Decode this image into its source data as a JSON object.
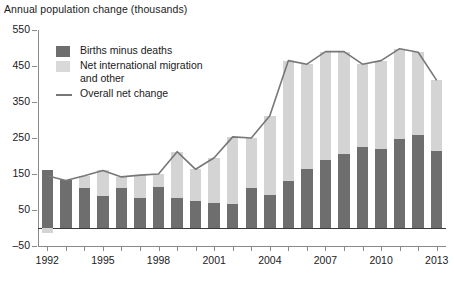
{
  "chart_data": {
    "type": "bar",
    "title": "Annual population change (thousands)",
    "xlabel": "",
    "ylabel": "",
    "ylim": [
      -50,
      550
    ],
    "yticks": [
      -50,
      50,
      150,
      250,
      350,
      450,
      550
    ],
    "ytick_labels": [
      "-50",
      "50",
      "150",
      "250",
      "350",
      "450",
      "550"
    ],
    "grid": false,
    "legend_position": "upper-left",
    "stacked": true,
    "categories": [
      1992,
      1993,
      1994,
      1995,
      1996,
      1997,
      1998,
      1999,
      2000,
      2001,
      2002,
      2003,
      2004,
      2005,
      2006,
      2007,
      2008,
      2009,
      2010,
      2011,
      2012,
      2013
    ],
    "xtick_labels": [
      "1992",
      "1995",
      "1998",
      "2001",
      "2004",
      "2007",
      "2010",
      "2013"
    ],
    "xtick_label_years": [
      1992,
      1995,
      1998,
      2001,
      2004,
      2007,
      2010,
      2013
    ],
    "series": [
      {
        "name": "Births minus deaths",
        "color": "#6e6e6e",
        "values": [
          160,
          132,
          110,
          88,
          112,
          82,
          115,
          82,
          75,
          70,
          68,
          110,
          92,
          130,
          165,
          190,
          205,
          225,
          220,
          248,
          258,
          215
        ]
      },
      {
        "name": "Net international migration and other",
        "color": "#d4d4d4",
        "values": [
          -15,
          0,
          35,
          72,
          30,
          65,
          35,
          130,
          88,
          125,
          185,
          140,
          220,
          335,
          290,
          300,
          285,
          230,
          245,
          250,
          230,
          195
        ]
      }
    ],
    "line_series": {
      "name": "Overall net change",
      "color": "#777777",
      "values": [
        145,
        132,
        145,
        160,
        142,
        147,
        150,
        212,
        163,
        195,
        253,
        250,
        312,
        465,
        455,
        490,
        490,
        455,
        465,
        498,
        488,
        410
      ]
    }
  },
  "legend": {
    "items": [
      {
        "label": "Births minus deaths",
        "marker": "swatch-dark"
      },
      {
        "label": "Net international migration\nand other",
        "marker": "swatch-light"
      },
      {
        "label": "Overall net change",
        "marker": "line"
      }
    ]
  },
  "colors": {
    "dark": "#6e6e6e",
    "light": "#d4d4d4",
    "line": "#777777",
    "axis": "#8a8a8a",
    "zero": "#3a3a3a",
    "background": "#ffffff"
  }
}
